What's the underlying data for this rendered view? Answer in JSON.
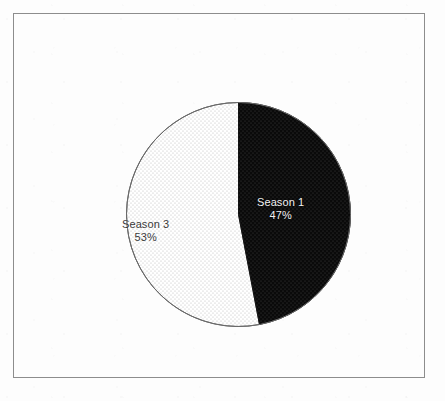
{
  "figure": {
    "background_color": "#fdfdfd",
    "frame_color": "#8d8d8d"
  },
  "chart_data": {
    "type": "pie",
    "title": "",
    "subtitle": "",
    "xlabel": "",
    "ylabel": "",
    "legend_position": "none",
    "grid": false,
    "labels_inside_slices": true,
    "start_angle_deg": 0,
    "direction": "clockwise",
    "categories": [
      "Season 1",
      "Season 3"
    ],
    "values": [
      47,
      53
    ],
    "value_unit": "%",
    "slices": [
      {
        "label": "Season 1",
        "value": 47,
        "percent_text": "47%",
        "start_angle_deg": 0,
        "sweep_angle_deg": 169.2,
        "fill_color": "#0a0a0a",
        "pattern": "fine-dot",
        "pattern_color": "#3c3c3c",
        "edge_color": "#111111",
        "text_color": "#f2f2f2"
      },
      {
        "label": "Season 3",
        "value": 53,
        "percent_text": "53%",
        "start_angle_deg": 169.2,
        "sweep_angle_deg": 190.8,
        "fill_color": "#ffffff",
        "pattern": "fine-dot",
        "pattern_color": "#b9b9b9",
        "edge_color": "#5a5a5a",
        "text_color": "#3a3a3a"
      }
    ]
  },
  "labels": {
    "season_1": {
      "name": "Season 1",
      "percent": "47%"
    },
    "season_3": {
      "name": "Season 3",
      "percent": "53%"
    }
  }
}
